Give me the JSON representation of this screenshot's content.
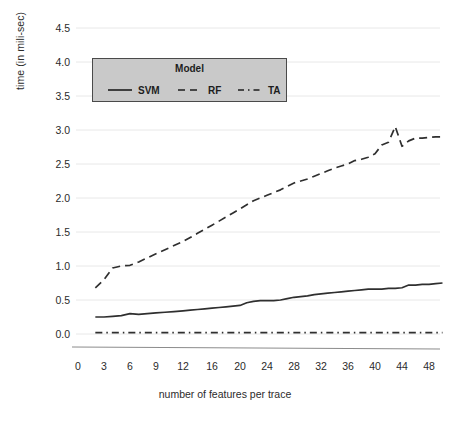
{
  "chart_data": {
    "type": "line",
    "title": "",
    "xlabel": "number of features per trace",
    "ylabel": "time (in mili-sec)",
    "xtick_labels": [
      "0",
      "3",
      "6",
      "9",
      "12",
      "16",
      "20",
      "24",
      "28",
      "32",
      "36",
      "40",
      "44",
      "48"
    ],
    "xtick_values": [
      0,
      3,
      6,
      9,
      12,
      16,
      20,
      24,
      28,
      32,
      36,
      40,
      44,
      48
    ],
    "ytick_labels": [
      "0.0",
      "0.5",
      "1.0",
      "1.5",
      "2.0",
      "2.5",
      "3.0",
      "3.5",
      "4.0",
      "4.5"
    ],
    "ytick_values": [
      0.0,
      0.5,
      1.0,
      1.5,
      2.0,
      2.5,
      3.0,
      3.5,
      4.0,
      4.5
    ],
    "xlim": [
      0,
      51
    ],
    "ylim": [
      0,
      4.5
    ],
    "grid": true,
    "grid_axis": "y",
    "legend_position": "upper left",
    "legend_title": "Model",
    "x": [
      2,
      3,
      4,
      5,
      6,
      7,
      8,
      9,
      10,
      11,
      12,
      13,
      14,
      15,
      16,
      17,
      18,
      19,
      20,
      21,
      22,
      23,
      24,
      25,
      26,
      27,
      28,
      29,
      30,
      31,
      32,
      33,
      34,
      35,
      36,
      37,
      38,
      39,
      40,
      41,
      42,
      43,
      44,
      45,
      46,
      47,
      48,
      49,
      50
    ],
    "series": [
      {
        "name": "SVM",
        "style": "solid",
        "color": "#2f2f2f",
        "values": [
          0.25,
          0.25,
          0.26,
          0.27,
          0.3,
          0.29,
          0.3,
          0.31,
          0.32,
          0.33,
          0.34,
          0.35,
          0.36,
          0.37,
          0.38,
          0.39,
          0.4,
          0.41,
          0.42,
          0.46,
          0.48,
          0.49,
          0.49,
          0.49,
          0.5,
          0.52,
          0.54,
          0.55,
          0.56,
          0.58,
          0.59,
          0.6,
          0.61,
          0.62,
          0.63,
          0.64,
          0.65,
          0.66,
          0.66,
          0.66,
          0.67,
          0.67,
          0.68,
          0.72,
          0.72,
          0.73,
          0.73,
          0.74,
          0.75
        ]
      },
      {
        "name": "RF",
        "style": "dashed",
        "color": "#2f2f2f",
        "values": [
          0.68,
          0.8,
          0.97,
          1.0,
          1.01,
          1.06,
          1.12,
          1.18,
          1.24,
          1.3,
          1.36,
          1.42,
          1.48,
          1.54,
          1.6,
          1.66,
          1.72,
          1.78,
          1.84,
          1.9,
          1.96,
          2.0,
          2.04,
          2.08,
          2.12,
          2.17,
          2.22,
          2.25,
          2.28,
          2.32,
          2.36,
          2.4,
          2.44,
          2.47,
          2.5,
          2.55,
          2.57,
          2.6,
          2.65,
          2.78,
          2.82,
          3.05,
          2.76,
          2.84,
          2.88,
          2.88,
          2.89,
          2.9,
          2.9
        ]
      },
      {
        "name": "TA",
        "style": "dashdot",
        "color": "#2f2f2f",
        "values": [
          0.02,
          0.02,
          0.02,
          0.02,
          0.02,
          0.02,
          0.02,
          0.02,
          0.02,
          0.02,
          0.02,
          0.02,
          0.02,
          0.02,
          0.02,
          0.02,
          0.02,
          0.02,
          0.02,
          0.02,
          0.02,
          0.02,
          0.02,
          0.02,
          0.02,
          0.02,
          0.02,
          0.02,
          0.02,
          0.02,
          0.02,
          0.02,
          0.02,
          0.02,
          0.02,
          0.02,
          0.02,
          0.02,
          0.02,
          0.02,
          0.02,
          0.02,
          0.02,
          0.02,
          0.02,
          0.02,
          0.02,
          0.02,
          0.02
        ]
      }
    ]
  },
  "axes": {
    "ylabel": "time (in mili-sec)",
    "xlabel": "number of features per trace",
    "yticks": [
      "4.5",
      "4.0",
      "3.5",
      "3.0",
      "2.5",
      "2.0",
      "1.5",
      "1.0",
      "0.5",
      "0.0"
    ],
    "xticks": [
      "0",
      "3",
      "6",
      "9",
      "12",
      "16",
      "20",
      "24",
      "28",
      "32",
      "36",
      "40",
      "44",
      "48"
    ]
  },
  "legend": {
    "title": "Model",
    "entries": [
      {
        "label": "SVM",
        "style": "solid"
      },
      {
        "label": "RF",
        "style": "dashed"
      },
      {
        "label": "TA",
        "style": "dashdot"
      }
    ]
  },
  "colors": {
    "line": "#2f2f2f",
    "grid": "#e8e8e8",
    "axis": "#8c8c8c",
    "legend_bg": "#c9c9c9",
    "legend_border": "#4a4a4a",
    "text": "#2b2b2b"
  }
}
